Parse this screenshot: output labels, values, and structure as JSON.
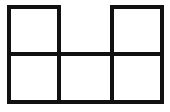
{
  "figure": {
    "kind": "grid-diagram",
    "title": "",
    "description": "Outline drawing of a six-cell square grid arranged as a hexomino-style net: a bottom row of three squares, with one square above the left column and one square above the right column; the cell above the middle column is absent.",
    "canvas": {
      "width": 170,
      "height": 112,
      "background_color": "#ffffff"
    },
    "style": {
      "stroke_color": "#111111",
      "stroke_width": 4,
      "fill_color": "none",
      "line_cap": "butt",
      "line_join": "miter"
    },
    "grid": {
      "columns": 3,
      "rows": 2,
      "left": 9,
      "top": 7,
      "right": 162,
      "bottom": 102,
      "column_x": [
        9,
        59,
        112,
        162
      ],
      "row_y": [
        7,
        54,
        102
      ],
      "cell_width_px": [
        50,
        53,
        50
      ],
      "cell_height_px": [
        47,
        48
      ]
    },
    "cells": [
      {
        "id": "r0c0",
        "row": 0,
        "col": 0,
        "present": true,
        "label": "top-left-square"
      },
      {
        "id": "r0c1",
        "row": 0,
        "col": 1,
        "present": false,
        "label": "top-middle-gap"
      },
      {
        "id": "r0c2",
        "row": 0,
        "col": 2,
        "present": true,
        "label": "top-right-square"
      },
      {
        "id": "r1c0",
        "row": 1,
        "col": 0,
        "present": true,
        "label": "bottom-left-square"
      },
      {
        "id": "r1c1",
        "row": 1,
        "col": 1,
        "present": true,
        "label": "bottom-middle-square"
      },
      {
        "id": "r1c2",
        "row": 1,
        "col": 2,
        "present": true,
        "label": "bottom-right-square"
      }
    ],
    "segments": [
      {
        "id": "seg-top-left",
        "name": "top-edge-left-square",
        "x1": 7,
        "y1": 7,
        "x2": 61,
        "y2": 7
      },
      {
        "id": "seg-top-right",
        "name": "top-edge-right-square",
        "x1": 110,
        "y1": 7,
        "x2": 164,
        "y2": 7
      },
      {
        "id": "seg-middle-h",
        "name": "middle-horizontal-line",
        "x1": 7,
        "y1": 54,
        "x2": 164,
        "y2": 54
      },
      {
        "id": "seg-bottom-h",
        "name": "bottom-horizontal-line",
        "x1": 7,
        "y1": 102,
        "x2": 164,
        "y2": 102
      },
      {
        "id": "seg-left-v",
        "name": "left-vertical-line",
        "x1": 9,
        "y1": 5,
        "x2": 9,
        "y2": 104
      },
      {
        "id": "seg-inner-v-1",
        "name": "first-inner-vertical-line",
        "x1": 59,
        "y1": 5,
        "x2": 59,
        "y2": 104
      },
      {
        "id": "seg-inner-v-2",
        "name": "second-inner-vertical-line",
        "x1": 112,
        "y1": 5,
        "x2": 112,
        "y2": 104
      },
      {
        "id": "seg-right-v",
        "name": "right-vertical-line",
        "x1": 162,
        "y1": 5,
        "x2": 162,
        "y2": 104
      }
    ]
  }
}
